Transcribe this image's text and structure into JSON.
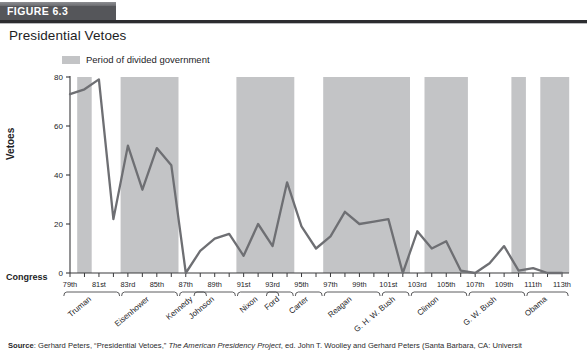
{
  "header": {
    "figure_label": "FIGURE 6.3",
    "title": "Presidential Vetoes"
  },
  "legend": {
    "swatch_name": "divided-government-swatch",
    "text": "Period of divided government",
    "swatch_color": "#c3c4c6"
  },
  "axis": {
    "y_label": "Vetoes",
    "x_group_label": "Congress",
    "y_ticks": [
      "0",
      "20",
      "40",
      "60",
      "80"
    ],
    "y_min": 0,
    "y_max": 80
  },
  "source": {
    "prefix": "Source",
    "text_1": ": Gerhard Peters, “Presidential Vetoes,” ",
    "italic": "The American Presidency Project",
    "text_2": ", ed. John T. Woolley and Gerhard Peters (Santa Barbara, CA: Universit"
  },
  "chart_data": {
    "type": "line",
    "title": "Presidential Vetoes",
    "xlabel": "Congress",
    "ylabel": "Vetoes",
    "ylim": [
      0,
      80
    ],
    "grid": false,
    "legend_position": "top",
    "line_color": "#6e6f73",
    "shade_color": "#c3c4c6",
    "categories": [
      "79th",
      "80th",
      "81st",
      "82nd",
      "83rd",
      "84th",
      "85th",
      "86th",
      "87th",
      "88th",
      "89th",
      "90th",
      "91st",
      "92nd",
      "93rd",
      "94th",
      "95th",
      "96th",
      "97th",
      "98th",
      "99th",
      "100th",
      "101st",
      "102nd",
      "103rd",
      "104th",
      "105th",
      "106th",
      "107th",
      "108th",
      "109th",
      "110th",
      "111th",
      "112th",
      "113th"
    ],
    "tick_labels_shown": [
      "79th",
      "81st",
      "83rd",
      "85th",
      "87th",
      "89th",
      "91st",
      "93rd",
      "95th",
      "97th",
      "99th",
      "101st",
      "103rd",
      "105th",
      "107th",
      "109th",
      "111th",
      "113th"
    ],
    "values": [
      73,
      75,
      79,
      22,
      52,
      34,
      51,
      44,
      0,
      9,
      14,
      16,
      7,
      20,
      11,
      37,
      19,
      10,
      15,
      25,
      20,
      21,
      22,
      0,
      17,
      10,
      13,
      1,
      0,
      4,
      11,
      1,
      2,
      0,
      0
    ],
    "presidents": [
      {
        "name": "Truman",
        "from": "79th",
        "to": "82nd"
      },
      {
        "name": "Eisenhower",
        "from": "83rd",
        "to": "86th"
      },
      {
        "name": "Kennedy",
        "from": "87th",
        "to": "88th"
      },
      {
        "name": "Johnson",
        "from": "88th",
        "to": "90th"
      },
      {
        "name": "Nixon",
        "from": "91st",
        "to": "93rd"
      },
      {
        "name": "Ford",
        "from": "93rd",
        "to": "94th"
      },
      {
        "name": "Carter",
        "from": "95th",
        "to": "96th"
      },
      {
        "name": "Reagan",
        "from": "97th",
        "to": "100th"
      },
      {
        "name": "G. H. W. Bush",
        "from": "101st",
        "to": "102nd"
      },
      {
        "name": "Clinton",
        "from": "103rd",
        "to": "106th"
      },
      {
        "name": "G. W. Bush",
        "from": "107th",
        "to": "110th"
      },
      {
        "name": "Obama",
        "from": "111th",
        "to": "113th"
      }
    ],
    "divided_government_bands": [
      {
        "from": "80th",
        "to": "80th"
      },
      {
        "from": "83rd",
        "to": "86th"
      },
      {
        "from": "91st",
        "to": "94th"
      },
      {
        "from": "97th",
        "to": "102nd"
      },
      {
        "from": "104th",
        "to": "106th"
      },
      {
        "from": "110th",
        "to": "110th"
      },
      {
        "from": "112th",
        "to": "113th"
      }
    ]
  }
}
